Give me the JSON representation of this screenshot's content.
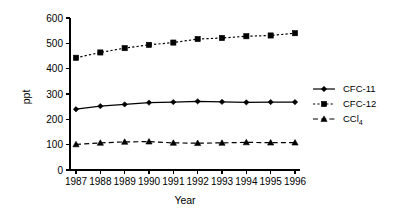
{
  "chart_data": {
    "type": "line",
    "title": "",
    "subtitle": "",
    "xlabel": "Year",
    "ylabel": "ppt",
    "categories": [
      "1987",
      "1988",
      "1989",
      "1990",
      "1991",
      "1992",
      "1993",
      "1994",
      "1995",
      "1996"
    ],
    "x": [
      1987,
      1988,
      1989,
      1990,
      1991,
      1992,
      1993,
      1994,
      1995,
      1996
    ],
    "xlim": [
      1986.5,
      1996.5
    ],
    "ylim": [
      0,
      600
    ],
    "yticks": [
      0,
      100,
      200,
      300,
      400,
      500,
      600
    ],
    "ytick_labels": [
      "0",
      "100",
      "200",
      "300",
      "400",
      "500",
      "600"
    ],
    "grid": false,
    "legend_position": "right",
    "series": [
      {
        "name": "CFC-11",
        "values": [
          240,
          252,
          259,
          266,
          268,
          271,
          269,
          267,
          268,
          268
        ],
        "marker": "diamond",
        "linestyle": "solid",
        "color": "#000000"
      },
      {
        "name": "CFC-12",
        "values": [
          443,
          464,
          481,
          494,
          503,
          517,
          521,
          528,
          531,
          540
        ],
        "marker": "square",
        "linestyle": "dotted",
        "color": "#000000"
      },
      {
        "name": "CCl4",
        "values": [
          101,
          107,
          111,
          112,
          107,
          106,
          107,
          109,
          108,
          108
        ],
        "marker": "triangle",
        "linestyle": "dashed",
        "color": "#000000",
        "label_base": "CCl",
        "label_sub": "4"
      }
    ]
  },
  "colors": {
    "ink": "#000000",
    "background": "#ffffff"
  }
}
